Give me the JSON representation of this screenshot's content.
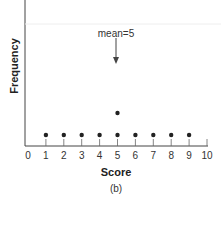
{
  "chart_data": {
    "type": "scatter",
    "subtype": "dot-plot",
    "xlabel": "Score",
    "ylabel": "Frequency",
    "caption": "(b)",
    "x_ticks": [
      "0",
      "1",
      "2",
      "3",
      "4",
      "5",
      "6",
      "7",
      "8",
      "9",
      "10"
    ],
    "xlim": [
      0,
      10
    ],
    "points": [
      {
        "x": 1,
        "y": 1
      },
      {
        "x": 2,
        "y": 1
      },
      {
        "x": 3,
        "y": 1
      },
      {
        "x": 4,
        "y": 1
      },
      {
        "x": 5,
        "y": 1
      },
      {
        "x": 5,
        "y": 2
      },
      {
        "x": 6,
        "y": 1
      },
      {
        "x": 7,
        "y": 1
      },
      {
        "x": 8,
        "y": 1
      },
      {
        "x": 9,
        "y": 1
      }
    ],
    "annotations": [
      {
        "text": "mean=5",
        "x": 5,
        "type": "arrow-down"
      }
    ],
    "grid": false,
    "legend": null
  }
}
